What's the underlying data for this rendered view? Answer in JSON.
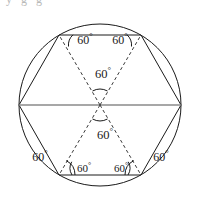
{
  "figure": {
    "title_fragment": "y  g    g",
    "canvas": {
      "width": 197,
      "height": 207
    },
    "colors": {
      "stroke": "#1a1a1a",
      "diameter": "#8a8a8a",
      "dashed": "#3a3a3a",
      "text": "#1a1a1a",
      "background": "#ffffff"
    },
    "circle": {
      "cx": 100,
      "cy": 105,
      "r": 81
    },
    "hexagon_vertices": [
      {
        "name": "left",
        "x": 19,
        "y": 105
      },
      {
        "name": "top-left",
        "x": 59,
        "y": 35
      },
      {
        "name": "top-right",
        "x": 141,
        "y": 35
      },
      {
        "name": "right",
        "x": 181,
        "y": 105
      },
      {
        "name": "bottom-right",
        "x": 141,
        "y": 175
      },
      {
        "name": "bottom-left",
        "x": 59,
        "y": 175
      }
    ],
    "diameter": {
      "x1": 19,
      "y1": 105,
      "x2": 181,
      "y2": 105
    },
    "dashed_radii": [
      {
        "name": "center-to-top-left",
        "x1": 100,
        "y1": 105,
        "x2": 59,
        "y2": 35
      },
      {
        "name": "center-to-top-right",
        "x1": 100,
        "y1": 105,
        "x2": 141,
        "y2": 35
      },
      {
        "name": "center-to-bottom-left",
        "x1": 100,
        "y1": 105,
        "x2": 59,
        "y2": 175
      },
      {
        "name": "center-to-bottom-right",
        "x1": 100,
        "y1": 105,
        "x2": 141,
        "y2": 175
      }
    ],
    "angle_labels": [
      {
        "id": "top-left-vertex",
        "text": "60",
        "degree": "°",
        "x": 85,
        "y": 39
      },
      {
        "id": "top-right-vertex",
        "text": "60",
        "degree": "°",
        "x": 120,
        "y": 39
      },
      {
        "id": "center-upper",
        "text": "60",
        "degree": "°",
        "x": 103,
        "y": 73
      },
      {
        "id": "center-lower",
        "text": "60",
        "degree": "°",
        "x": 105,
        "y": 134
      },
      {
        "id": "bottom-left-outer",
        "text": "60",
        "degree": "°",
        "x": 40,
        "y": 156
      },
      {
        "id": "bottom-left-inner",
        "text": "60",
        "degree": "°",
        "x": 84,
        "y": 168
      },
      {
        "id": "bottom-right-inner",
        "text": "60",
        "degree": "°",
        "x": 121,
        "y": 168
      },
      {
        "id": "bottom-right-outer",
        "text": "60",
        "degree": "°",
        "x": 161,
        "y": 156
      }
    ],
    "angle_arcs": [
      {
        "id": "arc-top-left-vertex",
        "d": "M 68.5 46.5 A 14 14 0 0 1 73.0 34.8"
      },
      {
        "id": "arc-top-right-vertex",
        "d": "M 127.0 34.8 A 14 14 0 0 1 131.5 46.5"
      },
      {
        "id": "arc-center-upper",
        "d": "M 92.5 91.0 A 16 16 0 0 1 107.5 91.0"
      },
      {
        "id": "arc-center-lower",
        "d": "M 92.5 119.0 A 16 16 0 0 0 107.5 119.0"
      },
      {
        "id": "arc-bottom-left-outer",
        "d": "M 75.0 175.0 A 16 16 0 0 0 66.2 160.6"
      },
      {
        "id": "arc-bottom-left-inner",
        "d": "M 71.7 161.8 A 13 13 0 0 0 72.0 175.0"
      },
      {
        "id": "arc-bottom-right-inner",
        "d": "M 128.0 175.0 A 13 13 0 0 0 128.3 161.8"
      },
      {
        "id": "arc-bottom-right-outer",
        "d": "M 133.8 160.6 A 16 16 0 0 0 125.0 175.0"
      }
    ]
  }
}
